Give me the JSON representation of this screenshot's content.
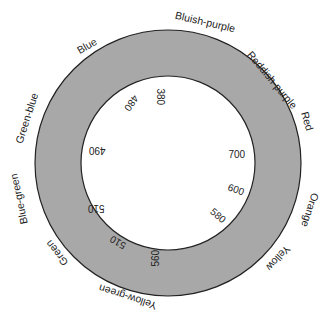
{
  "diagram": {
    "center": [
      168,
      163
    ],
    "outer_radius": 133,
    "inner_radius": 87,
    "ring_color": "#a8a8a8",
    "stroke_color": "#222222",
    "outer_labels": [
      {
        "text": "Blue",
        "x": 87,
        "y": 46,
        "rot": -30
      },
      {
        "text": "Bluish-purple",
        "x": 205,
        "y": 22,
        "rot": 13
      },
      {
        "text": "Reddish-purple",
        "x": 272,
        "y": 80,
        "rot": 50
      },
      {
        "text": "Red",
        "x": 307,
        "y": 121,
        "rot": 73
      },
      {
        "text": "Orange",
        "x": 310,
        "y": 210,
        "rot": 108
      },
      {
        "text": "Yellow",
        "x": 278,
        "y": 258,
        "rot": 133
      },
      {
        "text": "Yellow-green",
        "x": 128,
        "y": 297,
        "rot": 198
      },
      {
        "text": "Green",
        "x": 57,
        "y": 253,
        "rot": 232
      },
      {
        "text": "Blue-green",
        "x": 19,
        "y": 199,
        "rot": 258
      },
      {
        "text": "Green-blue",
        "x": 27,
        "y": 118,
        "rot": 288
      }
    ],
    "inner_labels": [
      {
        "text": "380",
        "x": 160,
        "y": 97,
        "rot": 90
      },
      {
        "text": "480",
        "x": 131,
        "y": 103,
        "rot": 125
      },
      {
        "text": "490",
        "x": 97,
        "y": 150,
        "rot": 180
      },
      {
        "text": "510",
        "x": 96,
        "y": 208,
        "rot": 180
      },
      {
        "text": "510",
        "x": 118,
        "y": 242,
        "rot": 210
      },
      {
        "text": "560",
        "x": 156,
        "y": 258,
        "rot": 270
      },
      {
        "text": "580",
        "x": 218,
        "y": 216,
        "rot": 40
      },
      {
        "text": "600",
        "x": 236,
        "y": 190,
        "rot": 20
      },
      {
        "text": "700",
        "x": 237,
        "y": 155,
        "rot": 0
      }
    ]
  }
}
